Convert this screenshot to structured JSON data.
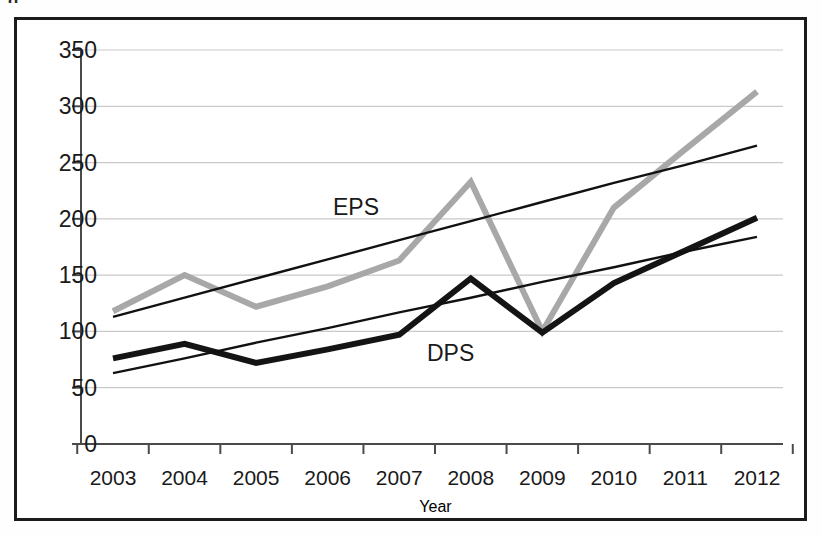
{
  "top_partial_text": "g",
  "chart_data": {
    "type": "line",
    "title": "",
    "xlabel": "Year",
    "ylabel": "",
    "categories": [
      "2003",
      "2004",
      "2005",
      "2006",
      "2007",
      "2008",
      "2009",
      "2010",
      "2011",
      "2012"
    ],
    "ylim": [
      0,
      350
    ],
    "ytick_step": 50,
    "yticks": [
      0,
      50,
      100,
      150,
      200,
      250,
      300,
      350
    ],
    "grid": true,
    "grid_axis": "y",
    "legend": "inline-labels",
    "series": [
      {
        "name": "EPS",
        "color": "#a8a8a8",
        "style": "thick-line",
        "label_text": "EPS",
        "values": [
          118,
          150,
          122,
          140,
          163,
          233,
          100,
          210,
          262,
          313
        ]
      },
      {
        "name": "DPS",
        "color": "#141414",
        "style": "thick-line",
        "label_text": "DPS",
        "values": [
          76,
          89,
          72,
          84,
          97,
          147,
          99,
          143,
          172,
          201
        ]
      },
      {
        "name": "EPS trendline",
        "color": "#111111",
        "style": "thin-line",
        "values": [
          113,
          130,
          147,
          164,
          181,
          198,
          215,
          232,
          248,
          265
        ]
      },
      {
        "name": "DPS trendline",
        "color": "#111111",
        "style": "thin-line",
        "values": [
          63,
          76,
          90,
          103,
          117,
          130,
          144,
          157,
          171,
          184
        ]
      }
    ]
  },
  "axis": {
    "y_tick_labels": [
      "350",
      "300",
      "250",
      "200",
      "150",
      "100",
      "50",
      "0"
    ],
    "x_tick_labels": [
      "2003",
      "2004",
      "2005",
      "2006",
      "2007",
      "2008",
      "2009",
      "2010",
      "2011",
      "2012"
    ],
    "x_title": "Year"
  },
  "annotations": {
    "eps_label": "EPS",
    "dps_label": "DPS"
  },
  "colors": {
    "frame": "#1b1b1b",
    "eps_series": "#a8a8a8",
    "dps_series": "#141414",
    "trendline": "#111111",
    "gridline": "#c9c9c9",
    "axis_line": "#4a4a4a",
    "text": "#1a1a1a",
    "background": "#ffffff"
  }
}
